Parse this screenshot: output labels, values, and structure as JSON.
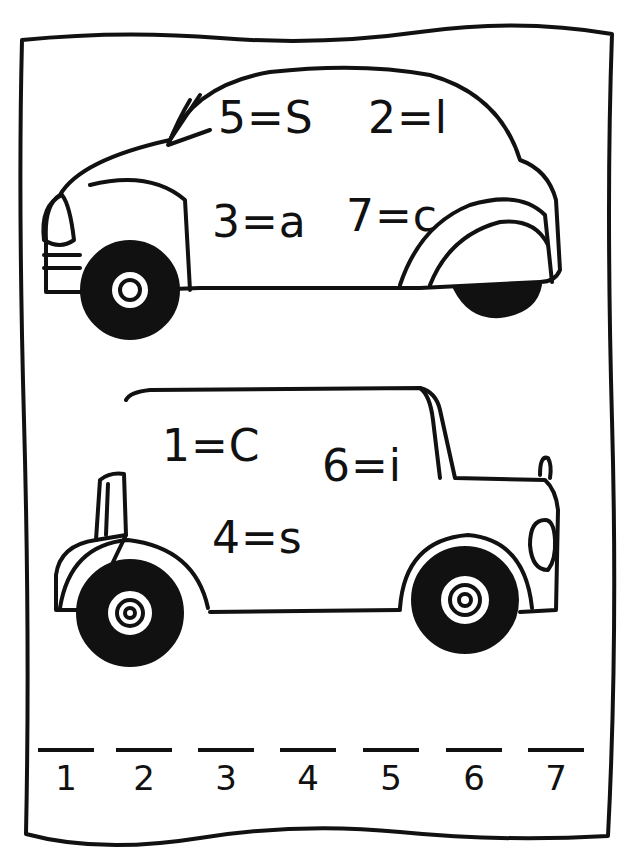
{
  "worksheet": {
    "car_top": {
      "clues": [
        {
          "text": "5=S"
        },
        {
          "text": "2=l"
        },
        {
          "text": "3=a"
        },
        {
          "text": "7=c"
        }
      ]
    },
    "car_bottom": {
      "clues": [
        {
          "text": "1=C"
        },
        {
          "text": "6=i"
        },
        {
          "text": "4=s"
        }
      ]
    },
    "answer_blanks": [
      {
        "number": "1"
      },
      {
        "number": "2"
      },
      {
        "number": "3"
      },
      {
        "number": "4"
      },
      {
        "number": "5"
      },
      {
        "number": "6"
      },
      {
        "number": "7"
      }
    ]
  }
}
